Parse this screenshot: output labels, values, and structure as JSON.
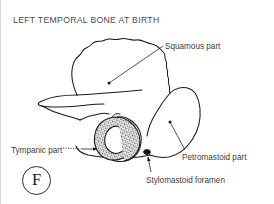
{
  "figure": {
    "title": "LEFT TEMPORAL BONE AT BIRTH",
    "panel_letter": "F",
    "ink_color": "#1a1a1a",
    "text_color": "#3d3d3d",
    "background_color": "#ffffff"
  },
  "labels": {
    "squamous": "Squamous part",
    "tympanic": "Tympanic part",
    "petromastoid": "Petromastoid part",
    "stylomastoid": "Stylomastoid foramen"
  }
}
